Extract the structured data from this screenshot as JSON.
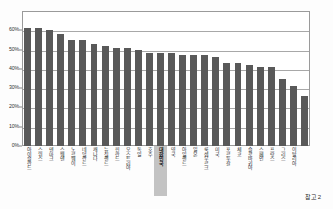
{
  "caption": "참고 2",
  "colors": {
    "bar": "#595959",
    "highlight_band": "#b9b9b9",
    "gridline": "#a8a8a8",
    "frame": "#9a9a9a",
    "background": "#ffffff"
  },
  "chart_data": {
    "type": "bar",
    "title": "",
    "subtitle": "",
    "xlabel": "",
    "ylabel": "",
    "ylim": [
      0,
      70
    ],
    "yticks": [
      0,
      10,
      20,
      30,
      40,
      50,
      60
    ],
    "ytick_labels": [
      "0%",
      "10%",
      "20%",
      "30%",
      "40%",
      "50%",
      "60%"
    ],
    "grid": true,
    "legend": "none",
    "highlight_category": "대한민국",
    "highlight_index": 12,
    "categories": [
      "아이슬란드",
      "스위스",
      "덴마크",
      "스웨덴",
      "노르웨이",
      "네덜란드",
      "캐나다",
      "뉴질랜드",
      "핀란드",
      "오스트리아",
      "독일",
      "호주",
      "대한민국",
      "영국",
      "아일랜드",
      "일본",
      "룩셈부르크",
      "미국",
      "포르투갈",
      "체코",
      "슬로바키아",
      "스페인",
      "프랑스",
      "그리스",
      "이탈리아"
    ],
    "values": [
      61,
      61,
      60,
      58,
      55,
      55,
      53,
      52,
      51,
      51,
      50,
      48,
      48,
      48,
      47,
      47,
      47,
      46,
      43,
      43,
      42,
      41,
      41,
      35,
      31
    ],
    "values_display": [
      "61%",
      "61%",
      "60%",
      "58%",
      "55%",
      "55%",
      "53%",
      "52%",
      "51%",
      "51%",
      "50%",
      "48%",
      "48%",
      "48%",
      "47%",
      "47%",
      "47%",
      "46%",
      "43%",
      "43%",
      "42%",
      "41%",
      "41%",
      "35%",
      "31%"
    ],
    "last_value": 26
  }
}
